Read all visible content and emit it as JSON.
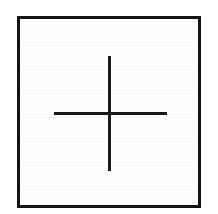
{
  "figure": {
    "background_color": "#ffffff",
    "canvas": {
      "width": 218,
      "height": 214
    },
    "frame": {
      "label": "square border",
      "stroke_color": "#141414",
      "stroke_width_px": 3,
      "left_px": 17,
      "top_px": 16,
      "width_px": 184,
      "height_px": 192
    },
    "cross": {
      "label": "plus mark",
      "stroke_color": "#1a1a1a",
      "stroke_width_px": 3,
      "center_x_px": 110,
      "center_y_px": 114,
      "vertical": {
        "label": "vertical stroke",
        "x_px": 108,
        "top_px": 56,
        "bottom_px": 171,
        "length_px": 115
      },
      "horizontal": {
        "label": "horizontal stroke",
        "y_px": 112,
        "left_px": 54,
        "right_px": 167,
        "length_px": 113
      }
    }
  },
  "chart_data": {
    "type": "scatter",
    "xlabel": "",
    "ylabel": "",
    "xlim": [
      17,
      201
    ],
    "ylim": [
      16,
      208
    ],
    "grid": false,
    "legend": null,
    "annotations": [
      {
        "name": "square-frame",
        "shape": "rectangle",
        "x": 17,
        "y": 16,
        "width": 184,
        "height": 192,
        "stroke": "#141414",
        "stroke_width": 3,
        "fill": "none"
      },
      {
        "name": "cross-vertical-stroke",
        "shape": "line",
        "x1": 109.5,
        "y1": 56,
        "x2": 109.5,
        "y2": 171,
        "stroke": "#1a1a1a",
        "stroke_width": 3
      },
      {
        "name": "cross-horizontal-stroke",
        "shape": "line",
        "x1": 54,
        "y1": 113.5,
        "x2": 167,
        "y2": 113.5,
        "stroke": "#1a1a1a",
        "stroke_width": 3
      }
    ],
    "x": [
      110
    ],
    "y": [
      114
    ],
    "series": [
      {
        "name": "cross-center",
        "x": [
          110
        ],
        "y": [
          114
        ],
        "marker": "plus",
        "color": "#1a1a1a"
      }
    ]
  }
}
